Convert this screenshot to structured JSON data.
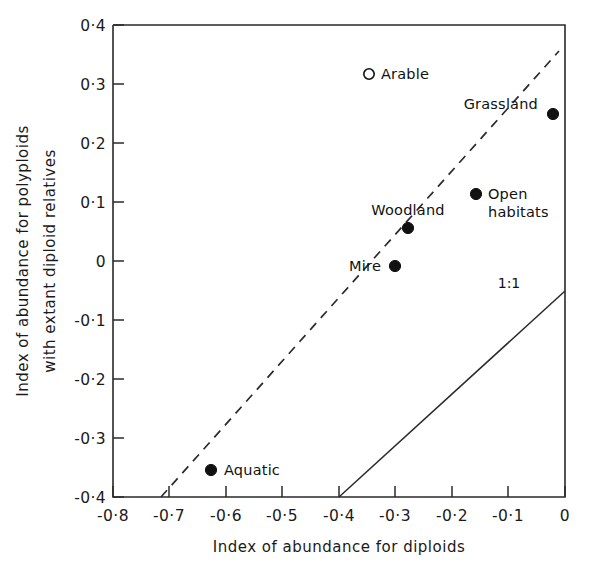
{
  "chart_data": {
    "type": "scatter",
    "title": "",
    "xlabel": "Index of abundance for diploids",
    "ylabel_line1": "Index of abundance for polyploids",
    "ylabel_line2": "with extant diploid relatives",
    "xlim": [
      -0.8,
      0.0
    ],
    "ylim": [
      -0.4,
      0.4
    ],
    "grid": false,
    "legend": "none",
    "xticks": [
      -0.8,
      -0.7,
      -0.6,
      -0.5,
      -0.4,
      -0.3,
      -0.2,
      -0.1,
      0.0
    ],
    "xticklabels": [
      "-0·8",
      "-0·7",
      "-0·6",
      "-0·5",
      "-0·4",
      "-0·3",
      "-0·2",
      "-0·1",
      "0"
    ],
    "yticks": [
      -0.4,
      -0.3,
      -0.2,
      -0.1,
      0.0,
      0.1,
      0.2,
      0.3,
      0.4
    ],
    "yticklabels": [
      "-0·4",
      "-0·3",
      "-0·2",
      "-0·1",
      "0",
      "0·1",
      "0·2",
      "0·3",
      "0·4"
    ],
    "points": [
      {
        "label": "Arable",
        "x": -0.365,
        "y": 0.325,
        "marker": "open",
        "label_pos": "right"
      },
      {
        "label": "Grassland",
        "x": -0.055,
        "y": 0.255,
        "marker": "filled",
        "label_pos": "left"
      },
      {
        "label": "Open habitats",
        "x": -0.195,
        "y": 0.12,
        "marker": "filled",
        "label_pos": "right"
      },
      {
        "label": "Woodland",
        "x": -0.32,
        "y": 0.062,
        "marker": "filled",
        "label_pos": "above"
      },
      {
        "label": "Mire",
        "x": -0.355,
        "y": 0.003,
        "marker": "filled",
        "label_pos": "left"
      },
      {
        "label": "Aquatic",
        "x": -0.64,
        "y": -0.335,
        "marker": "filled",
        "label_pos": "right"
      }
    ],
    "lines": [
      {
        "name": "fitted-line",
        "style": "dashed",
        "label": "",
        "x0": -0.715,
        "y0": -0.4,
        "x1": -0.01,
        "y1": 0.355
      },
      {
        "name": "one-to-one-line",
        "style": "solid",
        "label": "1:1",
        "x0": -0.4,
        "y0": -0.4,
        "x1": 0.0,
        "y1": -0.05
      }
    ],
    "line_label_text": "1:1"
  }
}
